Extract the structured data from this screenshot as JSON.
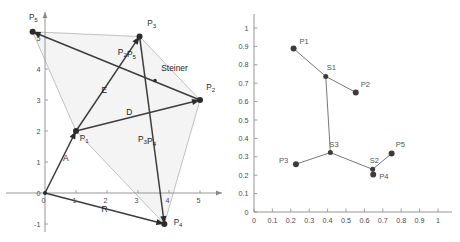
{
  "figure": {
    "title": "",
    "panels": [
      "steiner-tree-construction",
      "normalized-steiner-tree"
    ]
  },
  "chart_data": [
    {
      "type": "scatter",
      "id": "left-panel",
      "title": "",
      "xlabel": "",
      "ylabel": "",
      "xlim": [
        -0.8,
        5.9
      ],
      "ylim": [
        -1.45,
        5.75
      ],
      "grid": false,
      "legend": "none",
      "xticks": [
        0,
        1,
        2,
        3,
        4,
        5
      ],
      "xtick_labels": [
        "0",
        "1",
        "2",
        "3",
        "4",
        "5"
      ],
      "yticks": [
        0,
        1,
        2,
        3,
        4,
        5
      ],
      "ytick_labels": [
        "0",
        "1",
        "2",
        "3",
        "4",
        "5"
      ],
      "points": [
        {
          "name": "P1",
          "label": "P1",
          "x": 1.0,
          "y": 2.0
        },
        {
          "name": "P2",
          "label": "P2",
          "x": 5.0,
          "y": 3.0
        },
        {
          "name": "P3",
          "label": "P3",
          "x": 3.05,
          "y": 5.05
        },
        {
          "name": "P4",
          "label": "P4",
          "x": 3.85,
          "y": -1.0
        },
        {
          "name": "P5",
          "label": "P5",
          "x": -0.4,
          "y": 5.2
        },
        {
          "name": "O",
          "label": "",
          "x": 0.0,
          "y": 0.0
        },
        {
          "name": "Steiner",
          "label": "Steiner",
          "x": 3.55,
          "y": 3.63
        }
      ],
      "vectors": [
        {
          "name": "A",
          "label": "A",
          "from": "O",
          "to": "P1"
        },
        {
          "name": "R",
          "label": "R",
          "from": "O",
          "to": "P4"
        },
        {
          "name": "D",
          "label": "D",
          "from": "P1",
          "to": "P2"
        },
        {
          "name": "E",
          "label": "E",
          "from": "P1",
          "to": "P3"
        },
        {
          "name": "P2P5",
          "label": "P2P5",
          "from": "P2",
          "to": "P5"
        },
        {
          "name": "P3P4",
          "label": "P3P4",
          "from": "P3",
          "to": "P4"
        }
      ],
      "polygon": [
        "P5",
        "P3",
        "P2",
        "P4",
        "P1"
      ],
      "annotations": [
        {
          "text": "P2P5",
          "x": 2.35,
          "y": 4.45
        },
        {
          "text": "Steiner",
          "x": 3.75,
          "y": 3.95
        },
        {
          "text": "E",
          "x": 1.82,
          "y": 3.22
        },
        {
          "text": "D",
          "x": 2.62,
          "y": 2.52
        },
        {
          "text": "P3P4",
          "x": 3.0,
          "y": 1.65
        },
        {
          "text": "A",
          "x": 0.58,
          "y": 1.02
        },
        {
          "text": "R",
          "x": 1.82,
          "y": -0.62
        },
        {
          "text": "P1",
          "x": 1.12,
          "y": 1.68
        },
        {
          "text": "P2",
          "x": 5.2,
          "y": 3.32
        },
        {
          "text": "P3",
          "x": 3.3,
          "y": 5.38
        },
        {
          "text": "P4",
          "x": 4.15,
          "y": -1.02
        },
        {
          "text": "P5",
          "x": -0.52,
          "y": 5.58
        }
      ]
    },
    {
      "type": "scatter",
      "id": "right-panel",
      "title": "",
      "xlabel": "",
      "ylabel": "",
      "xlim": [
        -0.04,
        1.04
      ],
      "ylim": [
        -0.04,
        1.04
      ],
      "grid": false,
      "legend": "none",
      "xticks": [
        0,
        0.1,
        0.2,
        0.3,
        0.4,
        0.5,
        0.6,
        0.7,
        0.8,
        0.9,
        1
      ],
      "xtick_labels": [
        "0",
        "0.1",
        "0.2",
        "0.3",
        "0.4",
        "0.5",
        "0.6",
        "0.7",
        "0.8",
        "0.9",
        "1"
      ],
      "yticks": [
        0,
        0.1,
        0.2,
        0.3,
        0.4,
        0.5,
        0.6,
        0.7,
        0.8,
        0.9,
        1
      ],
      "ytick_labels": [
        "0",
        "0.1",
        "0.2",
        "0.3",
        "0.4",
        "0.5",
        "0.6",
        "0.7",
        "0.8",
        "0.9",
        "1"
      ],
      "points": [
        {
          "name": "P1",
          "label": "P1",
          "x": 0.215,
          "y": 0.888,
          "label_dx": 6,
          "label_dy": -5
        },
        {
          "name": "P2",
          "label": "P2",
          "x": 0.553,
          "y": 0.65,
          "label_dx": 5,
          "label_dy": -5
        },
        {
          "name": "P3",
          "label": "P3",
          "x": 0.228,
          "y": 0.26,
          "label_dx": -17,
          "label_dy": -1
        },
        {
          "name": "P4",
          "label": "P4",
          "x": 0.648,
          "y": 0.204,
          "label_dx": 6,
          "label_dy": 5
        },
        {
          "name": "P5",
          "label": "P5",
          "x": 0.748,
          "y": 0.318,
          "label_dx": 4,
          "label_dy": -6
        },
        {
          "name": "S1",
          "label": "S1",
          "x": 0.39,
          "y": 0.737,
          "label_dx": 1,
          "label_dy": -6
        },
        {
          "name": "S2",
          "label": "S2",
          "x": 0.645,
          "y": 0.232,
          "label_dx": -3,
          "label_dy": -6
        },
        {
          "name": "S3",
          "label": "S3",
          "x": 0.415,
          "y": 0.323,
          "label_dx": -1,
          "label_dy": -6
        }
      ],
      "edges": [
        {
          "from": "P1",
          "to": "S1"
        },
        {
          "from": "S1",
          "to": "P2"
        },
        {
          "from": "S1",
          "to": "S3"
        },
        {
          "from": "S3",
          "to": "P3"
        },
        {
          "from": "S3",
          "to": "S2"
        },
        {
          "from": "S2",
          "to": "P4"
        },
        {
          "from": "S2",
          "to": "P5"
        }
      ]
    }
  ]
}
